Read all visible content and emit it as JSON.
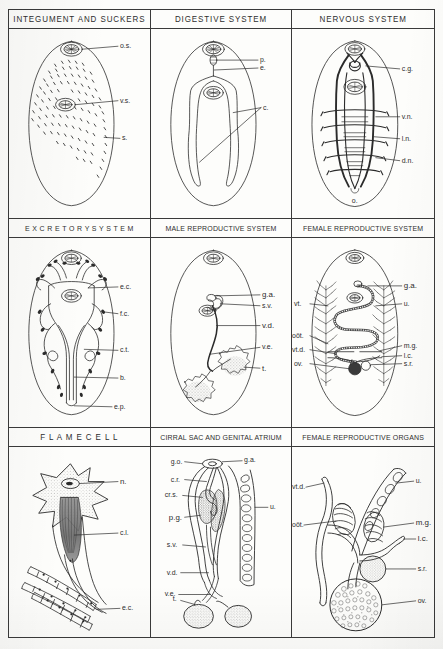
{
  "plate": {
    "subject": "Trematode (fluke) anatomy plate",
    "rows": 3,
    "columns": 3
  },
  "panels": [
    {
      "id": "integument-and-suckers",
      "title": "INTEGUMENT  AND SUCKERS",
      "labels": [
        {
          "key": "os",
          "text": "o.s."
        },
        {
          "key": "vs",
          "text": "v.s."
        },
        {
          "key": "s",
          "text": "s."
        }
      ]
    },
    {
      "id": "digestive-system",
      "title": "DIGESTIVE  SYSTEM",
      "labels": [
        {
          "key": "p",
          "text": "p."
        },
        {
          "key": "e",
          "text": "e."
        },
        {
          "key": "c",
          "text": "c."
        }
      ]
    },
    {
      "id": "nervous-system",
      "title": "NERVOUS  SYSTEM",
      "labels": [
        {
          "key": "cg",
          "text": "c.g."
        },
        {
          "key": "vn",
          "text": "v.n."
        },
        {
          "key": "ln",
          "text": "l.n."
        },
        {
          "key": "dn",
          "text": "d.n."
        },
        {
          "key": "o",
          "text": "o."
        }
      ]
    },
    {
      "id": "excretory-system",
      "title": "E X C R E T O R Y   S Y S T E M",
      "labels": [
        {
          "key": "ec",
          "text": "e.c."
        },
        {
          "key": "fc",
          "text": "f.c."
        },
        {
          "key": "ct",
          "text": "c.t."
        },
        {
          "key": "b",
          "text": "b."
        },
        {
          "key": "ep",
          "text": "e.p."
        }
      ]
    },
    {
      "id": "male-reproductive-system",
      "title": "MALE  REPRODUCTIVE  SYSTEM",
      "labels": [
        {
          "key": "ga",
          "text": "g.a."
        },
        {
          "key": "sv",
          "text": "s.v."
        },
        {
          "key": "vd",
          "text": "v.d."
        },
        {
          "key": "ve",
          "text": "v.e."
        },
        {
          "key": "t",
          "text": "t."
        }
      ]
    },
    {
      "id": "female-reproductive-system",
      "title": "FEMALE REPRODUCTIVE SYSTEM",
      "labels": [
        {
          "key": "vt",
          "text": "vt."
        },
        {
          "key": "oot",
          "text": "oöt."
        },
        {
          "key": "vtd",
          "text": "vt.d."
        },
        {
          "key": "ov",
          "text": "ov."
        },
        {
          "key": "ga",
          "text": "g.a."
        },
        {
          "key": "u",
          "text": "u."
        },
        {
          "key": "mg",
          "text": "m.g."
        },
        {
          "key": "lc",
          "text": "l.c."
        },
        {
          "key": "sr",
          "text": "s.r."
        }
      ]
    },
    {
      "id": "flame-cell",
      "title": "F L A M E   C E L L",
      "labels": [
        {
          "key": "n",
          "text": "n."
        },
        {
          "key": "cl",
          "text": "c.l."
        },
        {
          "key": "ec",
          "text": "e.c."
        }
      ]
    },
    {
      "id": "cirral-sac-and-genital-atrium",
      "title": "CIRRAL SAC AND GENITAL ATRIUM",
      "labels": [
        {
          "key": "go",
          "text": "g.o."
        },
        {
          "key": "ga",
          "text": "g.a."
        },
        {
          "key": "cr",
          "text": "c.r."
        },
        {
          "key": "crs",
          "text": "cr.s."
        },
        {
          "key": "pg",
          "text": "p.g."
        },
        {
          "key": "sv",
          "text": "s.v."
        },
        {
          "key": "u",
          "text": "u."
        },
        {
          "key": "vd",
          "text": "v.d."
        },
        {
          "key": "ve",
          "text": "v.e."
        },
        {
          "key": "t",
          "text": "t."
        }
      ]
    },
    {
      "id": "female-reproductive-organs",
      "title": "FEMALE  REPRODUCTIVE  ORGANS",
      "labels": [
        {
          "key": "vtd",
          "text": "vt.d."
        },
        {
          "key": "oot",
          "text": "oöt."
        },
        {
          "key": "u",
          "text": "u."
        },
        {
          "key": "mg",
          "text": "m.g."
        },
        {
          "key": "lc",
          "text": "l.c."
        },
        {
          "key": "sr",
          "text": "s.r."
        },
        {
          "key": "ov",
          "text": "ov."
        }
      ]
    }
  ],
  "colors": {
    "ink": "#2b2b2b",
    "rule": "#3a3a3a",
    "paper": "#fdfdfb",
    "fill_stipple": "#6e6e6e"
  }
}
